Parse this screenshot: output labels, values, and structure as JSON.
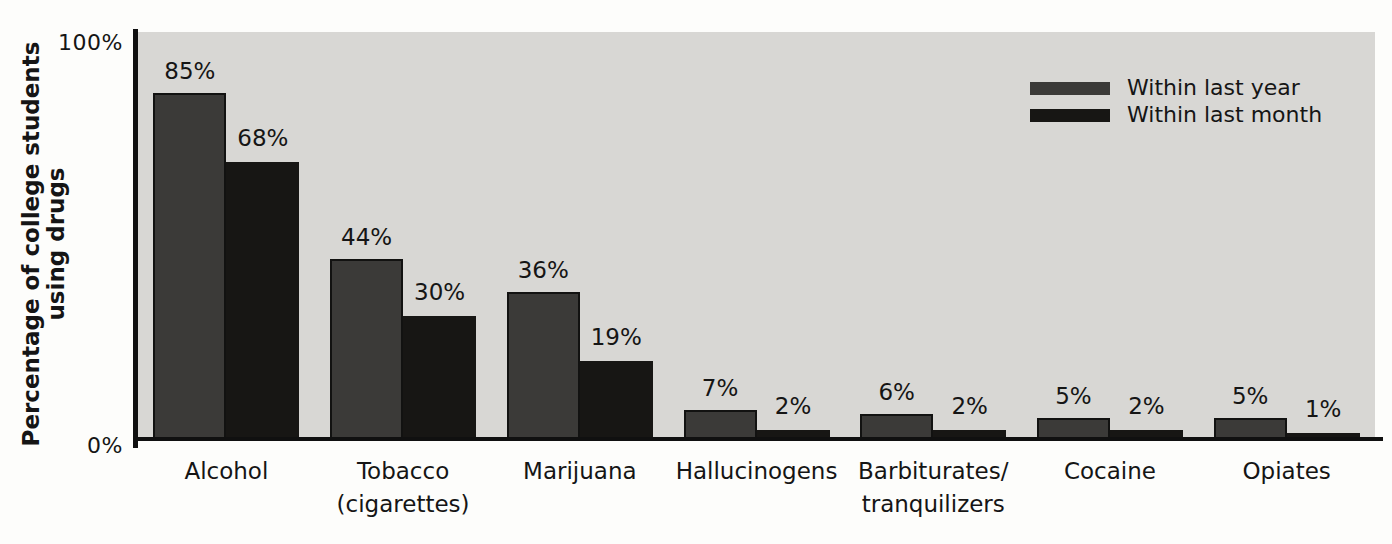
{
  "chart_data": {
    "type": "bar",
    "title": "",
    "ylabel_lines": [
      "Percentage of college students",
      "using drugs"
    ],
    "categories": [
      {
        "lines": [
          "Alcohol"
        ]
      },
      {
        "lines": [
          "Tobacco",
          "(cigarettes)"
        ]
      },
      {
        "lines": [
          "Marijuana"
        ]
      },
      {
        "lines": [
          "Hallucinogens"
        ]
      },
      {
        "lines": [
          "Barbiturates/",
          "tranquilizers"
        ]
      },
      {
        "lines": [
          "Cocaine"
        ]
      },
      {
        "lines": [
          "Opiates"
        ]
      }
    ],
    "series": [
      {
        "name": "Within last year",
        "color": "#3b3a38",
        "values": [
          85,
          44,
          36,
          7,
          6,
          5,
          5
        ]
      },
      {
        "name": "Within last month",
        "color": "#171614",
        "values": [
          68,
          30,
          19,
          2,
          2,
          2,
          1
        ]
      }
    ],
    "value_suffix": "%",
    "yticks": [
      {
        "value": 100,
        "label": "100%"
      },
      {
        "value": 0,
        "label": "0%"
      }
    ],
    "ylim": [
      0,
      100
    ],
    "grid": false,
    "legend_position": "top-right",
    "plot_background": "#d8d7d4",
    "axis_color": "#101010",
    "text_color": "#151515"
  }
}
